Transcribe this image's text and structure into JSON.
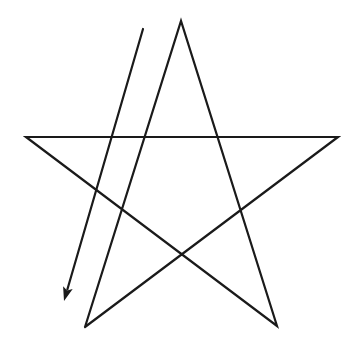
{
  "diagram": {
    "type": "pentagram-stroke-order",
    "background": "#ffffff",
    "stroke_color": "#1a1a1a",
    "stroke_width": 2.2,
    "star": {
      "vertices": {
        "top": [
          181,
          21
        ],
        "left": [
          26,
          137
        ],
        "right": [
          338,
          137
        ],
        "bottom_left": [
          85,
          327
        ],
        "bottom_right": [
          277,
          326
        ]
      },
      "path_order": [
        "bottom_left",
        "top",
        "bottom_right",
        "left",
        "right",
        "bottom_left"
      ]
    },
    "arrow": {
      "icon": "arrow-down-left-icon",
      "start": [
        143,
        29
      ],
      "end": [
        64,
        301
      ],
      "head_length": 14,
      "head_width": 10
    }
  }
}
